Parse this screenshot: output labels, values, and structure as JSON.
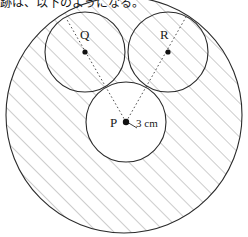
{
  "caption": {
    "text": "跡は、以下のようになる。"
  },
  "figure": {
    "type": "geometry-diagram",
    "stroke_color": "#2b2b2b",
    "hatch_color": "#9a9a9a",
    "background_color": "#ffffff",
    "big_circle": {
      "cx": 124,
      "cy": 115,
      "r": 118,
      "hatched": true
    },
    "small_circles": [
      {
        "label": "Q",
        "cx": 85,
        "cy": 52,
        "r": 40,
        "hatched": true
      },
      {
        "label": "R",
        "cx": 168,
        "cy": 52,
        "r": 40,
        "hatched": true
      },
      {
        "label": "P",
        "cx": 126,
        "cy": 122,
        "r": 40,
        "hatched": false
      }
    ],
    "center_dots": [
      {
        "label": "Q",
        "x": 85,
        "y": 52
      },
      {
        "label": "R",
        "x": 168,
        "y": 52
      },
      {
        "label": "P",
        "x": 126,
        "y": 122
      }
    ],
    "dotted_lines": [
      {
        "from": "P",
        "through": "Q",
        "x1": 126,
        "y1": 122,
        "x2": 66,
        "y2": 18
      },
      {
        "from": "P",
        "through": "R",
        "x1": 126,
        "y1": 122,
        "x2": 186,
        "y2": 17
      }
    ],
    "dimension": {
      "label": "3 cm",
      "value": 3,
      "unit": "cm",
      "from_x": 126,
      "from_y": 122,
      "to_x": 138,
      "to_y": 127
    },
    "labels": {
      "p": "P",
      "q": "Q",
      "r": "R",
      "radius": "3 cm"
    }
  }
}
